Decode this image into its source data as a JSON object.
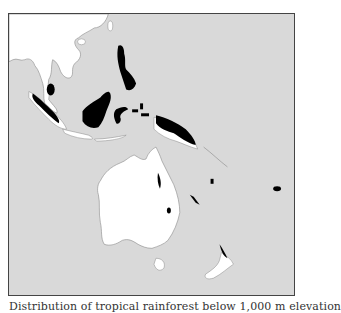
{
  "figure": {
    "caption": "Distribution of tropical rainforest below 1,000 m elevation",
    "map": {
      "region": "Southeast Asia and Australasia",
      "colors": {
        "ocean": "#d9d9d9",
        "land": "#ffffff",
        "forest": "#000000",
        "frame": "#444444",
        "coastline": "#888888"
      },
      "legend": []
    }
  }
}
